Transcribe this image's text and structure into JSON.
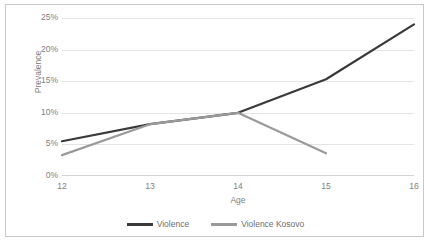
{
  "chart_data": {
    "type": "line",
    "title": "",
    "xlabel": "Age",
    "ylabel": "Prevalence",
    "x": [
      12,
      13,
      14,
      15,
      16
    ],
    "categories": [
      "12",
      "13",
      "14",
      "15",
      "16"
    ],
    "xtick_labels": [
      "12",
      "13",
      "14",
      "15",
      "16"
    ],
    "ytick_labels": [
      "0%",
      "5%",
      "10%",
      "15%",
      "20%",
      "25%"
    ],
    "ytick_values": [
      0,
      5,
      10,
      15,
      20,
      25
    ],
    "ylim": [
      0,
      25
    ],
    "xlim": [
      12,
      16
    ],
    "grid": "horizontal",
    "legend_position": "bottom",
    "series": [
      {
        "name": "Violence",
        "color": "#3a3a3a",
        "x": [
          12,
          13,
          14,
          15,
          16
        ],
        "values": [
          5.5,
          8.2,
          10.0,
          15.3,
          24.0
        ]
      },
      {
        "name": "Violence Kosovo",
        "color": "#9a9a9a",
        "x": [
          12,
          13,
          14,
          15
        ],
        "values": [
          3.3,
          8.2,
          10.0,
          3.6
        ]
      }
    ]
  },
  "legend": {
    "entries": [
      {
        "label": "Violence",
        "color": "#3a3a3a"
      },
      {
        "label": "Violence Kosovo",
        "color": "#9a9a9a"
      }
    ]
  },
  "colors": {
    "grid": "#e4e4e4",
    "axis": "#d2d2d2",
    "border": "#c8c8c8",
    "text": "#808080",
    "background": "#ffffff"
  }
}
